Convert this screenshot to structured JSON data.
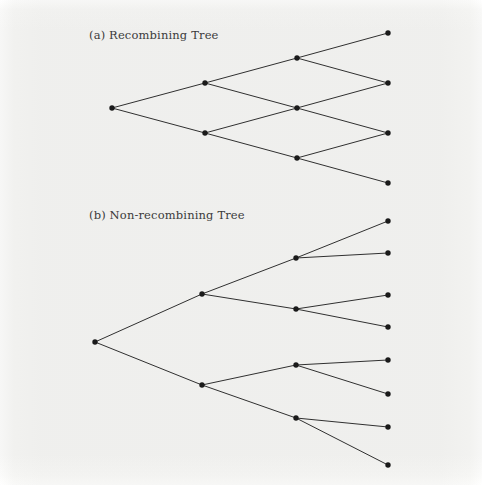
{
  "figure": {
    "background_color": "#f7f7f6",
    "ink_color": "#1a1a1a",
    "label_color": "#3b3b3b",
    "node_radius": 2.7,
    "edge_width": 0.9
  },
  "panels": [
    {
      "id": "recombining",
      "label": "(a) Recombining Tree",
      "label_position": {
        "x": 89,
        "y": 28
      },
      "type": "recombining-binomial-lattice",
      "steps": 3,
      "nodes": [
        {
          "id": "a0",
          "level": 0,
          "index": 0,
          "x": 112,
          "y": 108
        },
        {
          "id": "a1u",
          "level": 1,
          "index": 0,
          "x": 205,
          "y": 83
        },
        {
          "id": "a1d",
          "level": 1,
          "index": 1,
          "x": 205,
          "y": 133
        },
        {
          "id": "a2u",
          "level": 2,
          "index": 0,
          "x": 297,
          "y": 58
        },
        {
          "id": "a2m",
          "level": 2,
          "index": 1,
          "x": 297,
          "y": 108
        },
        {
          "id": "a2d",
          "level": 2,
          "index": 2,
          "x": 297,
          "y": 158
        },
        {
          "id": "a3a",
          "level": 3,
          "index": 0,
          "x": 388,
          "y": 33
        },
        {
          "id": "a3b",
          "level": 3,
          "index": 1,
          "x": 388,
          "y": 83
        },
        {
          "id": "a3c",
          "level": 3,
          "index": 2,
          "x": 388,
          "y": 133
        },
        {
          "id": "a3d",
          "level": 3,
          "index": 3,
          "x": 388,
          "y": 183
        }
      ],
      "edges": [
        [
          "a0",
          "a1u"
        ],
        [
          "a0",
          "a1d"
        ],
        [
          "a1u",
          "a2u"
        ],
        [
          "a1u",
          "a2m"
        ],
        [
          "a1d",
          "a2m"
        ],
        [
          "a1d",
          "a2d"
        ],
        [
          "a2u",
          "a3a"
        ],
        [
          "a2u",
          "a3b"
        ],
        [
          "a2m",
          "a3b"
        ],
        [
          "a2m",
          "a3c"
        ],
        [
          "a2d",
          "a3c"
        ],
        [
          "a2d",
          "a3d"
        ]
      ]
    },
    {
      "id": "non-recombining",
      "label": "(b) Non-recombining Tree",
      "label_position": {
        "x": 89,
        "y": 208
      },
      "type": "non-recombining-binary-tree",
      "steps": 3,
      "nodes": [
        {
          "id": "b0",
          "level": 0,
          "index": 0,
          "x": 95,
          "y": 342
        },
        {
          "id": "b1u",
          "level": 1,
          "index": 0,
          "x": 202,
          "y": 294
        },
        {
          "id": "b1d",
          "level": 1,
          "index": 1,
          "x": 202,
          "y": 385
        },
        {
          "id": "b2uu",
          "level": 2,
          "index": 0,
          "x": 296,
          "y": 258
        },
        {
          "id": "b2ud",
          "level": 2,
          "index": 1,
          "x": 296,
          "y": 309
        },
        {
          "id": "b2du",
          "level": 2,
          "index": 2,
          "x": 296,
          "y": 365
        },
        {
          "id": "b2dd",
          "level": 2,
          "index": 3,
          "x": 296,
          "y": 418
        },
        {
          "id": "b3a",
          "level": 3,
          "index": 0,
          "x": 388,
          "y": 221
        },
        {
          "id": "b3b",
          "level": 3,
          "index": 1,
          "x": 388,
          "y": 253
        },
        {
          "id": "b3c",
          "level": 3,
          "index": 2,
          "x": 388,
          "y": 295
        },
        {
          "id": "b3d",
          "level": 3,
          "index": 3,
          "x": 388,
          "y": 327
        },
        {
          "id": "b3e",
          "level": 3,
          "index": 4,
          "x": 388,
          "y": 360
        },
        {
          "id": "b3f",
          "level": 3,
          "index": 5,
          "x": 388,
          "y": 394
        },
        {
          "id": "b3g",
          "level": 3,
          "index": 6,
          "x": 388,
          "y": 427
        },
        {
          "id": "b3h",
          "level": 3,
          "index": 7,
          "x": 388,
          "y": 465
        }
      ],
      "edges": [
        [
          "b0",
          "b1u"
        ],
        [
          "b0",
          "b1d"
        ],
        [
          "b1u",
          "b2uu"
        ],
        [
          "b1u",
          "b2ud"
        ],
        [
          "b1d",
          "b2du"
        ],
        [
          "b1d",
          "b2dd"
        ],
        [
          "b2uu",
          "b3a"
        ],
        [
          "b2uu",
          "b3b"
        ],
        [
          "b2ud",
          "b3c"
        ],
        [
          "b2ud",
          "b3d"
        ],
        [
          "b2du",
          "b3e"
        ],
        [
          "b2du",
          "b3f"
        ],
        [
          "b2dd",
          "b3g"
        ],
        [
          "b2dd",
          "b3h"
        ]
      ]
    }
  ]
}
